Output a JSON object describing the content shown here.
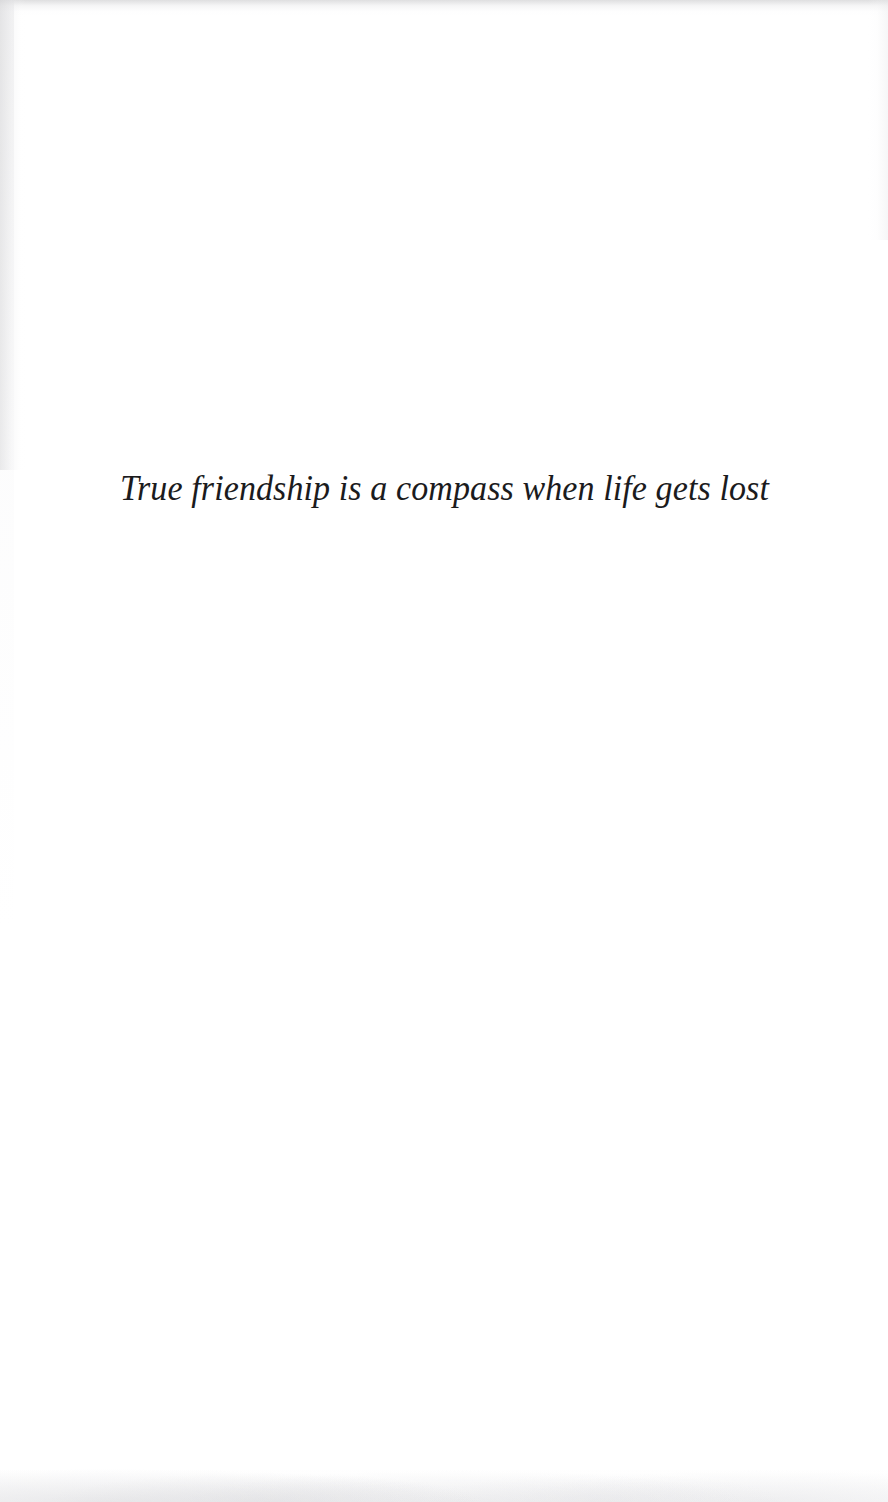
{
  "page": {
    "kind": "scanned-quote-page",
    "background_color": "#ffffff",
    "width": 888,
    "height": 1502
  },
  "quote": {
    "text": "True friendship is a compass when life gets lost",
    "style": "italic-serif",
    "color": "#1b1b1d",
    "alignment": "center"
  },
  "artifacts": {
    "top_edge_label": "scan-edge-top",
    "left_edge_label": "scan-edge-left",
    "right_edge_label": "scan-edge-right",
    "bottom_edge_label": "scan-edge-bottom",
    "edge_color": "#dcdcde"
  }
}
